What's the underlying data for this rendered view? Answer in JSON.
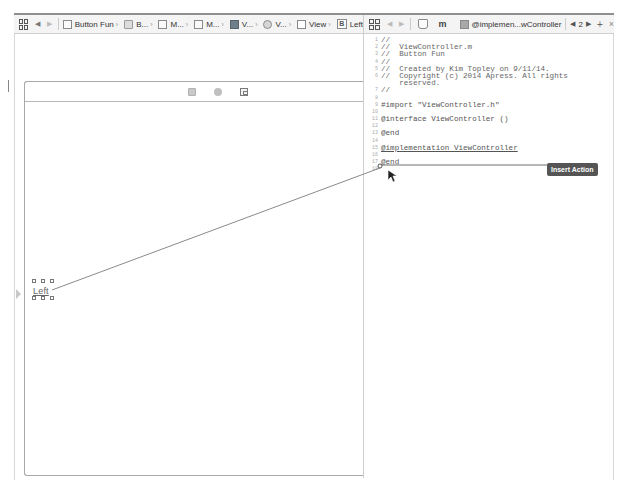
{
  "left_jumpbar": {
    "items": [
      {
        "icon": "file-icon",
        "label": "Button Fun"
      },
      {
        "icon": "folder-icon",
        "label": "B..."
      },
      {
        "icon": "file-icon",
        "label": "M..."
      },
      {
        "icon": "file-icon",
        "label": "M..."
      },
      {
        "icon": "storyboard-scene-icon",
        "label": "V..."
      },
      {
        "icon": "view-controller-icon",
        "label": "V..."
      },
      {
        "icon": "view-icon",
        "label": "View"
      },
      {
        "icon": "button-icon",
        "label": "Left",
        "glyph": "B"
      }
    ]
  },
  "right_jumpbar": {
    "file_glyph": "m",
    "symbol_label": "@implemen...wController",
    "counterpart_index": "2",
    "add_glyph": "+",
    "close_glyph": "×"
  },
  "scene": {
    "dock_icons": [
      "view-controller-icon",
      "first-responder-icon",
      "exit-icon"
    ],
    "button_label": "Left"
  },
  "code": {
    "lines": [
      {
        "n": "1",
        "text": "//",
        "style": "comment"
      },
      {
        "n": "2",
        "text": "//  ViewController.m",
        "style": "comment"
      },
      {
        "n": "3",
        "text": "//  Button Fun",
        "style": "comment"
      },
      {
        "n": "4",
        "text": "//",
        "style": "comment"
      },
      {
        "n": "5",
        "text": "//  Created by Kim Topley on 9/11/14.",
        "style": "comment"
      },
      {
        "n": "6",
        "text": "//  Copyright (c) 2014 Apress. All rights",
        "style": "comment"
      },
      {
        "n": "",
        "text": "    reserved.",
        "style": "comment"
      },
      {
        "n": "7",
        "text": "//",
        "style": "comment"
      },
      {
        "n": "8",
        "text": "",
        "style": "plain"
      },
      {
        "n": "9",
        "text": "#import \"ViewController.h\"",
        "style": "keyword"
      },
      {
        "n": "10",
        "text": "",
        "style": "plain"
      },
      {
        "n": "11",
        "text": "@interface ViewController ()",
        "style": "keyword"
      },
      {
        "n": "12",
        "text": "",
        "style": "plain"
      },
      {
        "n": "13",
        "text": "@end",
        "style": "keyword"
      },
      {
        "n": "14",
        "text": "",
        "style": "plain"
      },
      {
        "n": "15",
        "text": "@implementation ViewController",
        "style": "impl"
      },
      {
        "n": "16",
        "text": "",
        "style": "plain"
      },
      {
        "n": "17",
        "text": "@end",
        "style": "keyword"
      },
      {
        "n": "18",
        "text": "",
        "style": "plain"
      }
    ]
  },
  "popup": {
    "insert_action_label": "Insert Action"
  },
  "colors": {
    "connection_line": "#8a8a8a",
    "popup_bg": "#555555",
    "border": "#cfcfcf"
  }
}
